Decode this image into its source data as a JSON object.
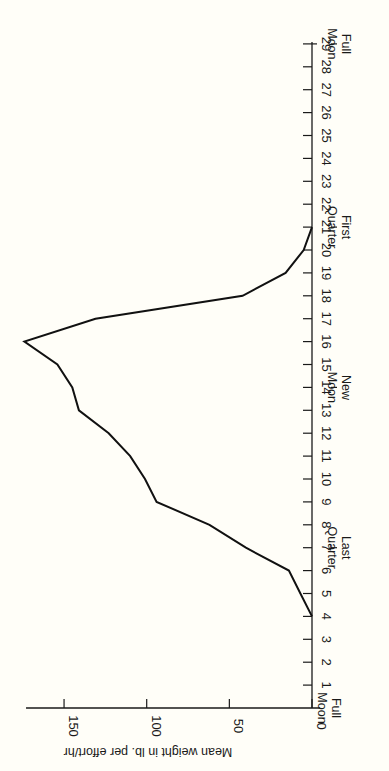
{
  "chart_data": {
    "type": "line",
    "title": "",
    "orientation": "rotated 90 degrees (day axis vertical on right, value axis horizontal at bottom)",
    "xlabel": "Lunar day",
    "ylabel": "Mean weight in lb. per effort/hr",
    "x_ticks": [
      1,
      2,
      3,
      4,
      5,
      6,
      7,
      8,
      9,
      10,
      11,
      12,
      13,
      14,
      15,
      16,
      17,
      18,
      19,
      20,
      21,
      22,
      23,
      24,
      25,
      26,
      27,
      28,
      29
    ],
    "y_ticks": [
      0,
      50,
      100,
      150
    ],
    "xlim": [
      0,
      29
    ],
    "ylim": [
      0,
      173
    ],
    "grid": false,
    "phase_annotations": [
      {
        "day": 0,
        "line1": "Full",
        "line2": "Moon"
      },
      {
        "day": 7,
        "line1": "Last",
        "line2": "Quarter"
      },
      {
        "day": 14,
        "line1": "New",
        "line2": "Moon"
      },
      {
        "day": 21,
        "line1": "First",
        "line2": "Quarter"
      },
      {
        "day": 29,
        "line1": "Full",
        "line2": "Moon"
      }
    ],
    "series": [
      {
        "name": "Mean weight",
        "x": [
          4,
          5,
          6,
          7,
          8,
          9,
          10,
          11,
          12,
          13,
          14,
          15,
          16,
          17,
          18,
          19,
          20,
          21
        ],
        "values": [
          0,
          7,
          14,
          40,
          62,
          94,
          101,
          110,
          123,
          141,
          145,
          154,
          174,
          131,
          42,
          16,
          5,
          0
        ]
      }
    ]
  }
}
